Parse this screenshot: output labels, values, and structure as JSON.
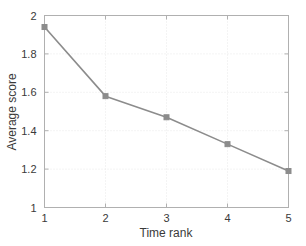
{
  "chart_data": {
    "type": "line",
    "title": "",
    "xlabel": "Time rank",
    "ylabel": "Average score",
    "categories": [
      "1",
      "2",
      "3",
      "4",
      "5"
    ],
    "x": [
      1,
      2,
      3,
      4,
      5
    ],
    "values": [
      1.94,
      1.58,
      1.47,
      1.33,
      1.19
    ],
    "series": [
      {
        "name": "Average score",
        "values": [
          1.94,
          1.58,
          1.47,
          1.33,
          1.19
        ]
      }
    ],
    "xlim": [
      1,
      5
    ],
    "ylim": [
      1,
      2
    ],
    "xticks": [
      "1",
      "2",
      "3",
      "4",
      "5"
    ],
    "yticks": [
      "1",
      "1.2",
      "1.4",
      "1.6",
      "1.8",
      "2"
    ],
    "xtick_values": [
      1,
      2,
      3,
      4,
      5
    ],
    "ytick_values": [
      1,
      1.2,
      1.4,
      1.6,
      1.8,
      2
    ],
    "grid": true,
    "legend": "none",
    "marker": "square",
    "line_color": "#8c8c8c",
    "marker_color": "#8c8c8c",
    "grid_color": "#e8e8e8",
    "axis_color": "#b0b0b0",
    "text_color": "#3a3a3a",
    "background": "#ffffff"
  }
}
